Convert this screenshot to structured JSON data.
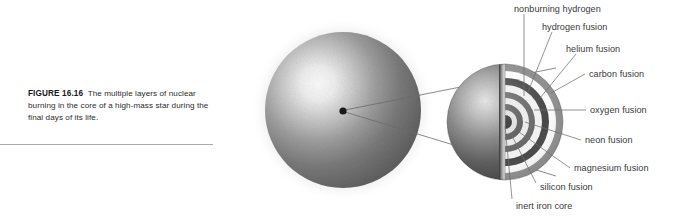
{
  "figure": {
    "number_label": "FIGURE 16.16",
    "caption": "The multiple layers of nuclear burning in the core of a high-mass star during the final days of its life.",
    "background_color": "#ffffff",
    "rule_color": "#a9abae",
    "label_color": "#3a3a3a"
  },
  "diagram": {
    "star": {
      "name": "high-mass star",
      "center_x": 343,
      "center_y": 110,
      "radius": 78,
      "highlight_color": "#f2f2f2",
      "edge_color": "#5d5d5d",
      "core_dot_color": "#1a1a1a"
    },
    "core_inset": {
      "name": "cutaway core",
      "center_x": 505,
      "center_y": 122,
      "radius": 50
    },
    "leader_lines": {
      "color": "#6b6b6b",
      "count": 2
    }
  },
  "callouts": [
    {
      "id": "nonburning-hydrogen",
      "label": "nonburning hydrogen",
      "x": 514,
      "y": 4,
      "tick_x": 524,
      "tick_y1": 14,
      "tick_x2": 524,
      "tick_y2": 96
    },
    {
      "id": "hydrogen-fusion",
      "label": "hydrogen fusion",
      "x": 542,
      "y": 22,
      "tick_x": 552,
      "tick_y1": 32,
      "tick_x2": 524,
      "tick_y2": 96
    },
    {
      "id": "helium-fusion",
      "label": "helium fusion",
      "x": 566,
      "y": 44,
      "tick_x": 576,
      "tick_y1": 54,
      "tick_x2": 540,
      "tick_y2": 96
    },
    {
      "id": "carbon-fusion",
      "label": "carbon fusion",
      "x": 589,
      "y": 69,
      "tick_x": 585,
      "tick_y1": 74,
      "tick_x2": 552,
      "tick_y2": 94
    },
    {
      "id": "oxygen-fusion",
      "label": "oxygen fusion",
      "x": 590,
      "y": 105,
      "tick_x": 586,
      "tick_y1": 110,
      "tick_x2": 531,
      "tick_y2": 110
    },
    {
      "id": "neon-fusion",
      "label": "neon fusion",
      "x": 585,
      "y": 135,
      "tick_x": 581,
      "tick_y1": 140,
      "tick_x2": 524,
      "tick_y2": 121
    },
    {
      "id": "magnesium-fusion",
      "label": "magnesium fusion",
      "x": 574,
      "y": 163,
      "tick_x": 570,
      "tick_y1": 168,
      "tick_x2": 518,
      "tick_y2": 131
    },
    {
      "id": "silicon-fusion",
      "label": "silicon fusion",
      "x": 540,
      "y": 182,
      "tick_x": 536,
      "tick_y1": 187,
      "tick_x2": 510,
      "tick_y2": 133
    },
    {
      "id": "inert-iron-core",
      "label": "inert iron core",
      "x": 516,
      "y": 201,
      "tick_x": 512,
      "tick_y1": 199,
      "tick_x2": 504,
      "tick_y2": 124
    }
  ],
  "shells": [
    {
      "id": "nonburning-hydrogen",
      "tone": "#8a8a8a"
    },
    {
      "id": "hydrogen-fusion",
      "tone": "#ffffff"
    },
    {
      "id": "helium-fusion",
      "tone": "#3f3f3f"
    },
    {
      "id": "carbon-fusion",
      "tone": "#f0f0f0"
    },
    {
      "id": "oxygen-fusion",
      "tone": "#5a5a5a"
    },
    {
      "id": "neon-fusion",
      "tone": "#e8e8e8"
    },
    {
      "id": "magnesium-fusion",
      "tone": "#4a4a4a"
    },
    {
      "id": "silicon-fusion",
      "tone": "#dcdcdc"
    },
    {
      "id": "inert-iron-core",
      "tone": "#141414"
    }
  ]
}
